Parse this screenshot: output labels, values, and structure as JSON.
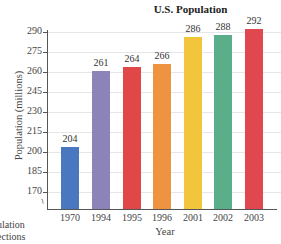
{
  "chart_data": {
    "type": "bar",
    "title": "U.S. Population",
    "xlabel": "Year",
    "ylabel": "Population (millions)",
    "categories": [
      "1970",
      "1994",
      "1995",
      "1996",
      "2001",
      "2002",
      "2003"
    ],
    "values": [
      204,
      261,
      264,
      266,
      286,
      288,
      292
    ],
    "colors": [
      "#4a78c0",
      "#8c84b8",
      "#e04848",
      "#ee9440",
      "#f2c53c",
      "#5aaf8a",
      "#e04850"
    ],
    "yticks": [
      170,
      185,
      200,
      215,
      230,
      245,
      260,
      275,
      290
    ],
    "ylim": [
      157,
      292
    ],
    "grid": true,
    "axis_break": true,
    "legend": null
  },
  "side_text": [
    "ulation",
    "ections"
  ]
}
